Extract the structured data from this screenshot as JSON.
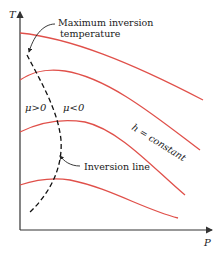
{
  "diagram": {
    "axes": {
      "y_label": "T",
      "x_label": "P"
    },
    "annotations": {
      "max_inversion_line1": "Maximum inversion",
      "max_inversion_line2": "temperature",
      "mu_positive": "μ>0",
      "mu_negative": "μ<0",
      "inversion_line": "Inversion line",
      "h_constant": "h = constant"
    },
    "curves": [
      {
        "name": "isenthalp-1"
      },
      {
        "name": "isenthalp-2"
      },
      {
        "name": "isenthalp-3"
      },
      {
        "name": "isenthalp-4"
      }
    ],
    "colors": {
      "curve": "#e0504a",
      "axis": "#333333",
      "dashed": "#111111"
    }
  }
}
